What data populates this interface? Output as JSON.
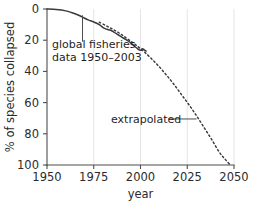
{
  "chart_data": {
    "type": "line",
    "title": "",
    "xlabel": "year",
    "ylabel": "% of species collapsed",
    "xlim": [
      1950,
      2050
    ],
    "ylim": [
      0,
      100
    ],
    "y_inverted": true,
    "grid": "vertical-faint",
    "legend": "none",
    "xticks": [
      1950,
      1975,
      2000,
      2025,
      2050
    ],
    "xtick_labels": [
      "1950",
      "1975",
      "2000",
      "2025",
      "2050"
    ],
    "yticks": [
      0,
      20,
      40,
      60,
      80,
      100
    ],
    "ytick_labels": [
      "0",
      "20",
      "40",
      "60",
      "80",
      "100"
    ],
    "series": [
      {
        "name": "global fisheries data 1950-2003",
        "style": "solid",
        "color": "#3a3a3a",
        "x": [
          1950,
          1955,
          1960,
          1963,
          1966,
          1969,
          1972,
          1975,
          1978,
          1980,
          1982,
          1984,
          1986,
          1988,
          1990,
          1992,
          1994,
          1996,
          1998,
          2000,
          2001,
          2002,
          2003
        ],
        "values": [
          0.0,
          0.4,
          1.2,
          2.2,
          3.5,
          5.2,
          7.0,
          8.3,
          10.0,
          12.0,
          13.0,
          13.6,
          15.0,
          16.5,
          18.0,
          19.5,
          21.0,
          23.0,
          25.0,
          26.5,
          25.5,
          26.2,
          27.0
        ]
      },
      {
        "name": "extrapolated",
        "style": "dashed",
        "color": "#3a3a3a",
        "x": [
          1978,
          1982,
          1986,
          1990,
          1994,
          1998,
          2002,
          2006,
          2010,
          2014,
          2018,
          2022,
          2026,
          2030,
          2034,
          2038,
          2042,
          2045,
          2048
        ],
        "values": [
          8.5,
          11.0,
          13.5,
          16.5,
          20.0,
          23.5,
          27.5,
          32.0,
          37.0,
          42.5,
          48.5,
          55.0,
          61.5,
          68.5,
          76.0,
          83.5,
          91.5,
          96.0,
          100.0
        ]
      }
    ],
    "annotations": [
      {
        "id": "data-annotation",
        "text_line1": "global fisheries",
        "text_line2": "data 1950–2003",
        "leader_from_x": 1969,
        "leader_from_y": 4.0,
        "leader_to_y": 21.0
      },
      {
        "id": "extrapolated-annotation",
        "text": "extrapolated",
        "leader_from_x": 2015,
        "leader_to_x": 2030,
        "leader_y": 70.5
      }
    ]
  }
}
